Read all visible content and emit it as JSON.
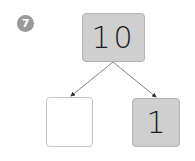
{
  "problem": {
    "number": "7"
  },
  "number_bond": {
    "whole": {
      "value": "10"
    },
    "parts": [
      {
        "value": ""
      },
      {
        "value": "1"
      }
    ]
  },
  "colors": {
    "filled_box": "#cfcfcf",
    "empty_box": "#ffffff",
    "badge": "#9a9a9a",
    "arrow": "#555555"
  }
}
